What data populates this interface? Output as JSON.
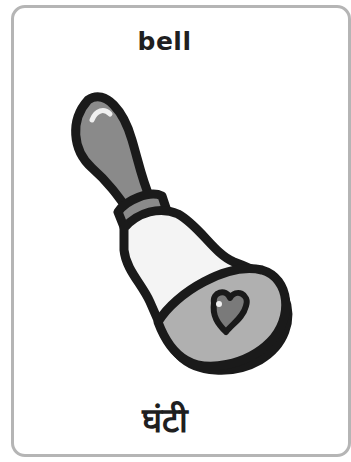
{
  "card": {
    "word_english": "bell",
    "word_hindi": "घंटी",
    "illustration": "bell-icon"
  },
  "colors": {
    "border": "#b5b5b5",
    "outline": "#1a1a1a",
    "handle": "#8a8a8a",
    "body": "#f4f4f4",
    "rim": "#b0b0b0",
    "heart": "#7a7a7a"
  }
}
